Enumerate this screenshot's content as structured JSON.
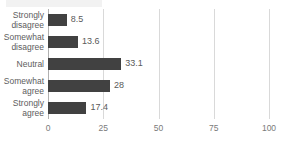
{
  "chart_data": {
    "type": "bar",
    "orientation": "horizontal",
    "title": "",
    "xlabel": "",
    "ylabel": "",
    "categories": [
      "Strongly\ndisagree",
      "Somewhat\ndisagree",
      "Neutral",
      "Somewhat\nagree",
      "Strongly\nagree"
    ],
    "values": [
      8.5,
      13.6,
      33.1,
      28,
      17.4
    ],
    "value_labels": [
      "8.5",
      "13.6",
      "33.1",
      "28",
      "17.4"
    ],
    "xlim": [
      0,
      100
    ],
    "xticks": [
      0,
      25,
      50,
      75,
      100
    ],
    "xtick_labels": [
      "0",
      "25",
      "50",
      "75",
      "100"
    ],
    "grid": "vertical",
    "legend": "none",
    "bar_color": "#414141",
    "gridline_color": "#d9d9d9",
    "axis_color": "#b0b0b0",
    "label_color": "#5d5d5d"
  }
}
